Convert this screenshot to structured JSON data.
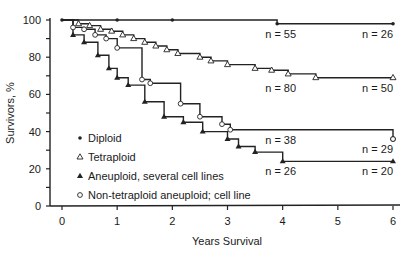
{
  "chart_data": {
    "type": "line",
    "subtype": "kaplan-meier step",
    "title": "",
    "xlabel": "Years Survival",
    "ylabel": "Survivors, %",
    "xlim": [
      0,
      6
    ],
    "ylim": [
      0,
      100
    ],
    "x_ticks": [
      "0",
      "1",
      "2",
      "3",
      "4",
      "5",
      "6"
    ],
    "y_ticks": [
      "0",
      "20",
      "40",
      "60",
      "80",
      "100"
    ],
    "grid": false,
    "legend_position": "lower-left inside",
    "series": [
      {
        "name": "Diploid",
        "marker": "dot",
        "points": [
          [
            0,
            100
          ],
          [
            3.9,
            100
          ],
          [
            3.9,
            98
          ],
          [
            6,
            98
          ]
        ],
        "censor_marks": [
          [
            0,
            100
          ],
          [
            1,
            100
          ],
          [
            2,
            100
          ],
          [
            3.9,
            98
          ],
          [
            6,
            98
          ]
        ],
        "annotations": [
          {
            "text": "n = 55",
            "x": 4,
            "y": 98
          },
          {
            "text": "n = 26",
            "x": 6,
            "y": 98
          }
        ]
      },
      {
        "name": "Tetraploid",
        "marker": "open-triangle",
        "points": [
          [
            0,
            100
          ],
          [
            0.3,
            100
          ],
          [
            0.3,
            98
          ],
          [
            0.5,
            98
          ],
          [
            0.5,
            97
          ],
          [
            0.7,
            97
          ],
          [
            0.7,
            95
          ],
          [
            0.9,
            95
          ],
          [
            0.9,
            94
          ],
          [
            1.1,
            94
          ],
          [
            1.1,
            92
          ],
          [
            1.3,
            92
          ],
          [
            1.3,
            90
          ],
          [
            1.5,
            90
          ],
          [
            1.5,
            88
          ],
          [
            1.7,
            88
          ],
          [
            1.7,
            86
          ],
          [
            1.9,
            86
          ],
          [
            1.9,
            84
          ],
          [
            2.1,
            84
          ],
          [
            2.1,
            82
          ],
          [
            2.5,
            82
          ],
          [
            2.5,
            80
          ],
          [
            2.7,
            80
          ],
          [
            2.7,
            78
          ],
          [
            3.0,
            78
          ],
          [
            3.0,
            76
          ],
          [
            3.5,
            76
          ],
          [
            3.5,
            74
          ],
          [
            3.8,
            74
          ],
          [
            3.8,
            73
          ],
          [
            4.1,
            73
          ],
          [
            4.1,
            71
          ],
          [
            4.6,
            71
          ],
          [
            4.6,
            69
          ],
          [
            6,
            69
          ]
        ],
        "annotations": [
          {
            "text": "n = 80",
            "x": 4,
            "y": 69
          },
          {
            "text": "n = 50",
            "x": 6,
            "y": 69
          }
        ]
      },
      {
        "name": "Aneuploid, several cell lines",
        "marker": "filled-triangle",
        "points": [
          [
            0,
            100
          ],
          [
            0.2,
            100
          ],
          [
            0.2,
            92
          ],
          [
            0.4,
            92
          ],
          [
            0.4,
            88
          ],
          [
            0.65,
            88
          ],
          [
            0.65,
            81
          ],
          [
            0.85,
            81
          ],
          [
            0.85,
            74
          ],
          [
            1.0,
            74
          ],
          [
            1.0,
            69
          ],
          [
            1.2,
            69
          ],
          [
            1.2,
            65
          ],
          [
            1.5,
            65
          ],
          [
            1.5,
            56
          ],
          [
            1.85,
            56
          ],
          [
            1.85,
            48
          ],
          [
            2.2,
            48
          ],
          [
            2.2,
            45
          ],
          [
            2.55,
            45
          ],
          [
            2.55,
            40
          ],
          [
            3.0,
            40
          ],
          [
            3.0,
            36
          ],
          [
            3.2,
            36
          ],
          [
            3.2,
            32
          ],
          [
            3.5,
            32
          ],
          [
            3.5,
            29
          ],
          [
            4.0,
            29
          ],
          [
            4.0,
            24
          ],
          [
            6,
            24
          ]
        ],
        "annotations": [
          {
            "text": "n = 26",
            "x": 4,
            "y": 24
          },
          {
            "text": "n = 20",
            "x": 6,
            "y": 24
          }
        ]
      },
      {
        "name": "Non-tetraploid aneuploid; cell line",
        "marker": "open-circle",
        "points": [
          [
            0,
            100
          ],
          [
            0.2,
            100
          ],
          [
            0.2,
            96
          ],
          [
            0.4,
            96
          ],
          [
            0.4,
            95
          ],
          [
            0.6,
            95
          ],
          [
            0.6,
            92
          ],
          [
            0.8,
            92
          ],
          [
            0.8,
            90
          ],
          [
            1.0,
            90
          ],
          [
            1.0,
            85
          ],
          [
            1.45,
            85
          ],
          [
            1.45,
            68
          ],
          [
            1.6,
            68
          ],
          [
            1.6,
            66
          ],
          [
            2.15,
            66
          ],
          [
            2.15,
            55
          ],
          [
            2.5,
            55
          ],
          [
            2.5,
            48
          ],
          [
            2.9,
            48
          ],
          [
            2.9,
            44
          ],
          [
            3.05,
            44
          ],
          [
            3.05,
            41
          ],
          [
            6,
            41
          ],
          [
            6,
            36
          ]
        ],
        "annotations": [
          {
            "text": "n = 38",
            "x": 4,
            "y": 41
          },
          {
            "text": "n = 29",
            "x": 6,
            "y": 36
          }
        ]
      }
    ]
  },
  "legend": [
    {
      "symbol": "•",
      "label": "Diploid"
    },
    {
      "symbol": "△",
      "label": "Tetraploid"
    },
    {
      "symbol": "▲",
      "label": "Aneuploid, several cell lines"
    },
    {
      "symbol": "○",
      "label": "Non-tetraploid aneuploid; cell line"
    }
  ]
}
